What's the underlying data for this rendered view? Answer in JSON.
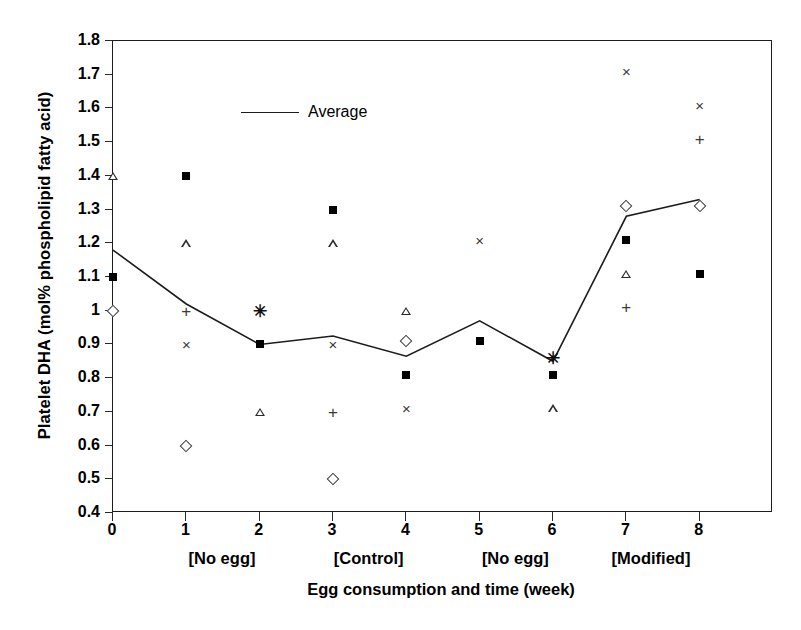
{
  "chart_data": {
    "type": "scatter",
    "title": "",
    "xlabel": "Egg consumption and time (week)",
    "ylabel": "Platelet DHA (mol% phospholipid fatty acid)",
    "xlim": [
      0,
      9
    ],
    "ylim": [
      0.4,
      1.8
    ],
    "x_ticks": [
      "0",
      "1",
      "2",
      "3",
      "4",
      "5",
      "6",
      "7",
      "8"
    ],
    "y_ticks": [
      "0.4",
      "0.5",
      "0.6",
      "0.7",
      "0.8",
      "0.9",
      "1",
      "1.1",
      "1.2",
      "1.3",
      "1.4",
      "1.5",
      "1.6",
      "1.7",
      "1.8"
    ],
    "grid": false,
    "legend": {
      "position": "top-left",
      "entries": [
        {
          "label": "Average",
          "marker": "line",
          "color": "#1c1c1c"
        }
      ]
    },
    "group_labels": [
      {
        "label": "[No egg]",
        "center_week": 1.5
      },
      {
        "label": "[Control]",
        "center_week": 3.5
      },
      {
        "label": "[No egg]",
        "center_week": 5.5
      },
      {
        "label": "[Modified]",
        "center_week": 7.35
      }
    ],
    "series": [
      {
        "name": "Average",
        "marker": "line",
        "x": [
          0,
          1,
          2,
          3,
          4,
          5,
          6,
          7,
          8
        ],
        "values": [
          1.18,
          1.02,
          0.9,
          0.925,
          0.865,
          0.97,
          0.85,
          1.28,
          1.33
        ]
      },
      {
        "name": "Subject square",
        "marker": "filled-square",
        "points": [
          {
            "x": 0,
            "y": 1.1
          },
          {
            "x": 1,
            "y": 1.4
          },
          {
            "x": 2,
            "y": 0.9
          },
          {
            "x": 3,
            "y": 1.3
          },
          {
            "x": 4,
            "y": 0.81
          },
          {
            "x": 5,
            "y": 0.91
          },
          {
            "x": 6,
            "y": 0.81
          },
          {
            "x": 7,
            "y": 1.21
          },
          {
            "x": 8,
            "y": 1.11
          }
        ]
      },
      {
        "name": "Subject triangle",
        "marker": "open-triangle",
        "points": [
          {
            "x": 0,
            "y": 1.4
          },
          {
            "x": 1,
            "y": 1.2
          },
          {
            "x": 2,
            "y": 0.7
          },
          {
            "x": 3,
            "y": 1.2
          },
          {
            "x": 4,
            "y": 1.0
          },
          {
            "x": 6,
            "y": 0.71
          },
          {
            "x": 7,
            "y": 1.11
          }
        ]
      },
      {
        "name": "Subject diamond",
        "marker": "open-diamond",
        "points": [
          {
            "x": 0,
            "y": 1.0
          },
          {
            "x": 1,
            "y": 0.6
          },
          {
            "x": 3,
            "y": 0.5
          },
          {
            "x": 4,
            "y": 0.91
          },
          {
            "x": 7,
            "y": 1.31
          },
          {
            "x": 8,
            "y": 1.31
          }
        ]
      },
      {
        "name": "Subject cross",
        "marker": "x-cross",
        "points": [
          {
            "x": 1,
            "y": 0.9
          },
          {
            "x": 3,
            "y": 0.9
          },
          {
            "x": 4,
            "y": 0.71
          },
          {
            "x": 5,
            "y": 1.21
          },
          {
            "x": 7,
            "y": 1.71
          },
          {
            "x": 8,
            "y": 1.61
          }
        ]
      },
      {
        "name": "Subject plus",
        "marker": "plus",
        "points": [
          {
            "x": 1,
            "y": 1.0
          },
          {
            "x": 3,
            "y": 0.7
          },
          {
            "x": 7,
            "y": 1.01
          },
          {
            "x": 8,
            "y": 1.51
          }
        ]
      },
      {
        "name": "Subject asterisk",
        "marker": "asterisk",
        "points": [
          {
            "x": 2,
            "y": 1.0
          },
          {
            "x": 6,
            "y": 0.86
          }
        ]
      }
    ]
  }
}
